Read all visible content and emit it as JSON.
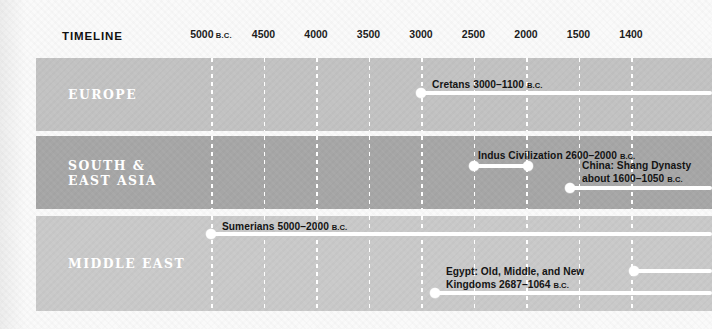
{
  "title": "TIMELINE",
  "axis": {
    "ticks": [
      {
        "label": "5000",
        "era": "B.C.",
        "x": 211
      },
      {
        "label": "4500",
        "era": "",
        "x": 263.5
      },
      {
        "label": "4000",
        "era": "",
        "x": 316
      },
      {
        "label": "3500",
        "era": "",
        "x": 368.5
      },
      {
        "label": "3000",
        "era": "",
        "x": 421
      },
      {
        "label": "2500",
        "era": "",
        "x": 473.5
      },
      {
        "label": "2000",
        "era": "",
        "x": 526
      },
      {
        "label": "1500",
        "era": "",
        "x": 578.5
      },
      {
        "label": "1400",
        "era": "",
        "x": 631
      }
    ]
  },
  "bands": [
    {
      "id": "europe",
      "label": "EUROPE",
      "color": "#c2c2c2"
    },
    {
      "id": "asia",
      "label": "SOUTH &\nEAST ASIA",
      "color": "#a6a6a6"
    },
    {
      "id": "mideast",
      "label": "MIDDLE EAST",
      "color": "#c9c9c9"
    }
  ],
  "events": [
    {
      "id": "cretans",
      "band": "europe",
      "text": "Cretans 3000–1100 ",
      "era": "B.C.",
      "start_year": 3000,
      "end_year": 1100,
      "start_x": 421,
      "end_x": 712,
      "open_end": true,
      "dots": [
        "start"
      ]
    },
    {
      "id": "indus",
      "band": "asia",
      "text": "Indus Civilization 2600–2000 ",
      "era": "B.C.",
      "start_year": 2600,
      "end_year": 2000,
      "start_x": 473.5,
      "end_x": 528,
      "open_end": false,
      "dots": [
        "start",
        "end"
      ]
    },
    {
      "id": "shang",
      "band": "asia",
      "text": "China: Shang Dynasty\nabout 1600–1050 ",
      "era": "B.C.",
      "start_year": 1600,
      "end_year": 1050,
      "start_x": 570,
      "end_x": 712,
      "open_end": true,
      "dots": [
        "start"
      ]
    },
    {
      "id": "sumerians",
      "band": "mideast",
      "text": "Sumerians 5000–2000 ",
      "era": "B.C.",
      "start_year": 5000,
      "end_year": 2000,
      "start_x": 211,
      "end_x": 712,
      "open_end": true,
      "dots": [
        "start"
      ]
    },
    {
      "id": "egypt",
      "band": "mideast",
      "text": "Egypt: Old, Middle, and New\nKingdoms 2687–1064 ",
      "era": "B.C.",
      "start_year": 2687,
      "end_year": 1064,
      "start_x": 435,
      "end_x": 712,
      "open_end": true,
      "dots": [
        "start"
      ]
    },
    {
      "id": "mideast-upper",
      "band": "mideast",
      "text": "",
      "era": "",
      "start_x": 634,
      "end_x": 712,
      "open_end": true,
      "dots": [
        "start"
      ]
    }
  ],
  "colors": {
    "bar": "#ffffff",
    "text": "#141414",
    "band_light": "#c9c9c9",
    "band_mid": "#c2c2c2",
    "band_dark": "#a6a6a6"
  }
}
